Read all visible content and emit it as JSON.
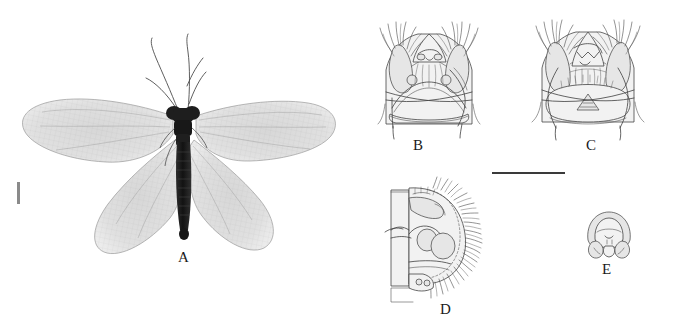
{
  "figure": {
    "background_color": "#ffffff",
    "width": 675,
    "height": 332,
    "panel_labels": {
      "a": "A",
      "b": "B",
      "c": "C",
      "d": "D",
      "e": "E"
    },
    "panels": [
      {
        "id": "a",
        "label": "A",
        "type": "photograph",
        "subject": "adult lacewing habitus, dorsal view with four membranous wings and long antennae",
        "label_x": 178,
        "label_y": 250
      },
      {
        "id": "b",
        "label": "B",
        "type": "line-drawing",
        "subject": "terminal abdominal segments, ventral view with setose lobes",
        "label_x": 414,
        "label_y": 143
      },
      {
        "id": "c",
        "label": "C",
        "type": "line-drawing",
        "subject": "terminal abdominal segments, ventral view variant with setose lobes",
        "label_x": 590,
        "label_y": 144
      },
      {
        "id": "d",
        "label": "D",
        "type": "line-drawing",
        "subject": "terminal abdominal segments, lateral view with marginal setae",
        "label_x": 440,
        "label_y": 312
      },
      {
        "id": "e",
        "label": "E",
        "type": "line-drawing",
        "subject": "small sclerite detail, caudal view",
        "label_x": 605,
        "label_y": 270
      }
    ],
    "scale_bars": [
      {
        "name": "scale-bar-habitus",
        "orientation": "vertical",
        "x": 17,
        "y": 182,
        "length": 22,
        "thickness": 3,
        "color": "#8a8a8a",
        "caption": ""
      },
      {
        "name": "scale-bar-genitalia",
        "orientation": "horizontal",
        "x": 492,
        "y": 172,
        "length": 73,
        "thickness": 2,
        "color": "#3a3a3a",
        "caption": ""
      }
    ],
    "colors": {
      "ink": "#3f3f3f",
      "fill_light": "#f2f2f2",
      "fill_mid": "#e6e6e6",
      "body_dark": "#1e1e1e",
      "wing_membrane": "#d9d9d9"
    }
  }
}
